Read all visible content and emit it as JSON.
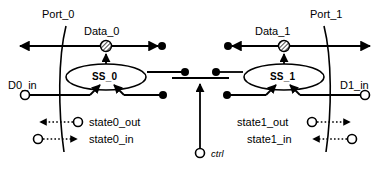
{
  "diagram": {
    "ink_color": "#000000",
    "background_color": "#ffffff",
    "ports": [
      {
        "id": "port0",
        "label": "Port_0",
        "label_x": 42,
        "label_y": 8
      },
      {
        "id": "port1",
        "label": "Port_1",
        "label_x": 310,
        "label_y": 8
      }
    ],
    "data_nodes": [
      {
        "id": "data0",
        "label": "Data_0",
        "label_x": 84,
        "label_y": 25,
        "node_x": 106,
        "node_y": 46
      },
      {
        "id": "data1",
        "label": "Data_1",
        "label_x": 255,
        "label_y": 25,
        "node_x": 284,
        "node_y": 46
      }
    ],
    "state_machines": [
      {
        "id": "ss0",
        "label": "SS_0",
        "cx": 106,
        "cy": 77,
        "rx": 40,
        "ry": 13
      },
      {
        "id": "ss1",
        "label": "SS_1",
        "cx": 284,
        "cy": 77,
        "rx": 40,
        "ry": 13
      }
    ],
    "data_inputs": [
      {
        "id": "d0in",
        "label": "D0_in",
        "label_x": 8,
        "label_y": 81,
        "port_x": 25,
        "port_y": 95
      },
      {
        "id": "d1in",
        "label": "D1_in",
        "label_x": 340,
        "label_y": 81,
        "port_x": 365,
        "port_y": 95
      }
    ],
    "state_signals": [
      {
        "id": "state0_out",
        "label": "state0_out",
        "label_x": 90,
        "label_y": 116,
        "circle_x": 78,
        "circle_y": 122,
        "arrow_x": 36,
        "direction": "left"
      },
      {
        "id": "state0_in",
        "label": "state0_in",
        "label_x": 90,
        "label_y": 133,
        "circle_x": 38,
        "circle_y": 139,
        "arrow_x": 80,
        "direction": "right"
      },
      {
        "id": "state1_out",
        "label": "state1_out",
        "label_x": 238,
        "label_y": 116,
        "circle_x": 312,
        "circle_y": 122,
        "arrow_x": 354,
        "direction": "right"
      },
      {
        "id": "state1_in",
        "label": "state1_in",
        "label_x": 248,
        "label_y": 133,
        "circle_x": 352,
        "circle_y": 139,
        "arrow_x": 310,
        "direction": "left"
      }
    ],
    "control": {
      "id": "ctrl",
      "label": "ctrl",
      "label_x": 212,
      "label_y": 148,
      "circle_x": 200,
      "circle_y": 153,
      "bar_y": 78,
      "bar_x1": 172,
      "bar_x2": 229
    },
    "junction_dots": [
      {
        "id": "data0-line-end",
        "x": 162,
        "y": 46
      },
      {
        "id": "data1-line-end",
        "x": 228,
        "y": 46
      },
      {
        "id": "ss0-right-dot",
        "x": 185,
        "y": 72
      },
      {
        "id": "ss1-left-dot",
        "x": 216,
        "y": 72
      },
      {
        "id": "d0-feed-dot",
        "x": 163,
        "y": 95
      },
      {
        "id": "d1-feed-dot",
        "x": 227,
        "y": 95
      }
    ]
  }
}
